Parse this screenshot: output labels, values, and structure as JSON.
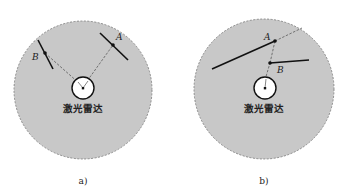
{
  "figure": {
    "colors": {
      "range_fill": "#c8c8c8",
      "range_border": "#777777",
      "wall_line": "#111111",
      "ray_dash": "#666666",
      "lidar_fill": "#ffffff"
    },
    "panels": [
      {
        "id": "a",
        "caption": "a)",
        "lidar_label": "激光雷达",
        "points": [
          {
            "name": "A",
            "label": "A"
          },
          {
            "name": "B",
            "label": "B"
          }
        ],
        "description": "Two separate wall segments; rays from lidar hit A and B on different segments"
      },
      {
        "id": "b",
        "caption": "b)",
        "lidar_label": "激光雷达",
        "points": [
          {
            "name": "A",
            "label": "A"
          },
          {
            "name": "B",
            "label": "B"
          }
        ],
        "description": "Single ray passes through B on near segment, extended dashed to A on farther segment (occlusion)"
      }
    ]
  }
}
